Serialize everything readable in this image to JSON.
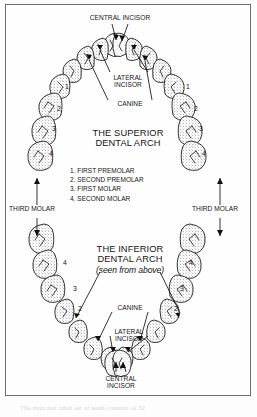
{
  "figure": {
    "background_color": "#fdfdfd",
    "ink_color": "#141414",
    "frame_color": "#6d6d6d"
  },
  "titles": {
    "superior": "THE SUPERIOR\nDENTAL ARCH",
    "inferior": "THE INFERIOR\nDENTAL ARCH",
    "inferior_note": "(seen from above)"
  },
  "legend": {
    "items": [
      "1. FIRST PREMOLAR",
      "2. SECOND PREMOLAR",
      "3. FIRST MOLAR",
      "4. SECOND MOLAR"
    ],
    "text": "1. FIRST PREMOLAR\n2. SECOND PREMOLAR\n3. FIRST MOLAR\n4. SECOND MOLAR"
  },
  "labels": {
    "top_central_incisor": "CENTRAL INCISOR",
    "top_lateral_incisor": "LATERAL\nINCISOR",
    "top_canine": "CANINE",
    "third_molar_left": "THIRD MOLAR",
    "third_molar_right": "THIRD MOLAR",
    "bottom_canine": "CANINE",
    "bottom_lateral_incisor": "LATERAL\nINCISOR",
    "bottom_central_incisor": "CENTRAL\nINCISOR"
  },
  "tooth_numbers": {
    "upper_left": [
      "1",
      "2",
      "3",
      "4"
    ],
    "upper_right": [
      "1",
      "2",
      "3",
      "4"
    ],
    "lower_left": [
      "4",
      "3",
      "2"
    ],
    "lower_right": [
      "4",
      "3",
      "2"
    ]
  },
  "caption": {
    "text": "The man and adult set of teeth consists of 32"
  }
}
